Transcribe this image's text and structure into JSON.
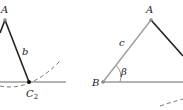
{
  "left_panel": {
    "vertex_a_label": "A",
    "side_b_label": "b",
    "vertex_c2_label": "C",
    "vertex_c2_subscript": "2"
  },
  "right_panel": {
    "vertex_a_label": "A",
    "vertex_b_label": "B",
    "side_c_label": "c",
    "angle_label": "β"
  },
  "colors": {
    "dark_line": "#222222",
    "gray_line": "#9a9a9a",
    "dashed_arc": "#6a6a6a",
    "point_gray": "#8a8a8a"
  }
}
